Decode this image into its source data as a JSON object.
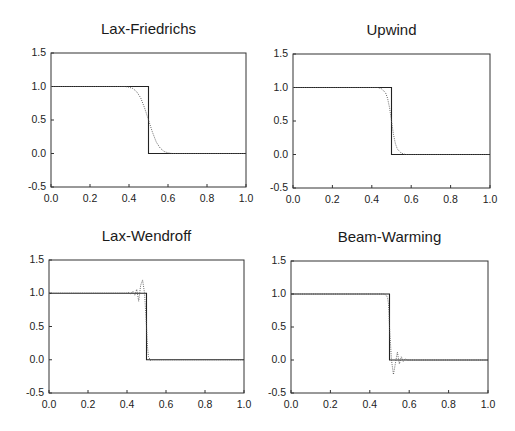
{
  "figure": {
    "panels": [
      {
        "id": "lax-friedrichs",
        "title": "Lax-Friedrichs",
        "box": {
          "left": 51,
          "top": 53,
          "right": 246,
          "bottom": 187
        }
      },
      {
        "id": "upwind",
        "title": "Upwind",
        "box": {
          "left": 293,
          "top": 54,
          "right": 490,
          "bottom": 188
        }
      },
      {
        "id": "lax-wendroff",
        "title": "Lax-Wendroff",
        "box": {
          "left": 49,
          "top": 260,
          "right": 244,
          "bottom": 393
        }
      },
      {
        "id": "beam-warming",
        "title": "Beam-Warming",
        "box": {
          "left": 291,
          "top": 261,
          "right": 488,
          "bottom": 393
        }
      }
    ],
    "xticks": [
      "0.0",
      "0.2",
      "0.4",
      "0.6",
      "0.8",
      "1.0"
    ],
    "yticks": [
      "1.5",
      "1.0",
      "0.5",
      "0.0",
      "-0.5"
    ]
  },
  "chart_data": [
    {
      "type": "line",
      "title": "Lax-Friedrichs",
      "xlabel": "",
      "ylabel": "",
      "xlim": [
        0,
        1
      ],
      "ylim": [
        -0.5,
        1.5
      ],
      "xticks": [
        0,
        0.2,
        0.4,
        0.6,
        0.8,
        1.0
      ],
      "yticks": [
        -0.5,
        0,
        0.5,
        1.0,
        1.5
      ],
      "grid": false,
      "series": [
        {
          "name": "exact",
          "style": "solid",
          "x": [
            0,
            0.5,
            0.5,
            1.0
          ],
          "y": [
            1,
            1,
            0,
            0
          ]
        },
        {
          "name": "numerical",
          "style": "dotted",
          "x": [
            0,
            0.38,
            0.4,
            0.42,
            0.44,
            0.46,
            0.48,
            0.5,
            0.52,
            0.54,
            0.56,
            0.58,
            0.6,
            0.62,
            1.0
          ],
          "y": [
            1,
            1,
            0.99,
            0.97,
            0.92,
            0.83,
            0.68,
            0.5,
            0.32,
            0.17,
            0.08,
            0.03,
            0.01,
            0,
            0
          ]
        }
      ]
    },
    {
      "type": "line",
      "title": "Upwind",
      "xlabel": "",
      "ylabel": "",
      "xlim": [
        0,
        1
      ],
      "ylim": [
        -0.5,
        1.5
      ],
      "xticks": [
        0,
        0.2,
        0.4,
        0.6,
        0.8,
        1.0
      ],
      "yticks": [
        -0.5,
        0,
        0.5,
        1.0,
        1.5
      ],
      "grid": false,
      "series": [
        {
          "name": "exact",
          "style": "solid",
          "x": [
            0,
            0.5,
            0.5,
            1.0
          ],
          "y": [
            1,
            1,
            0,
            0
          ]
        },
        {
          "name": "numerical",
          "style": "dotted",
          "x": [
            0,
            0.43,
            0.45,
            0.47,
            0.48,
            0.49,
            0.5,
            0.51,
            0.52,
            0.53,
            0.55,
            0.57,
            1.0
          ],
          "y": [
            1,
            1,
            0.98,
            0.92,
            0.84,
            0.7,
            0.5,
            0.3,
            0.16,
            0.08,
            0.02,
            0,
            0
          ]
        }
      ]
    },
    {
      "type": "line",
      "title": "Lax-Wendroff",
      "xlabel": "",
      "ylabel": "",
      "xlim": [
        0,
        1
      ],
      "ylim": [
        -0.5,
        1.5
      ],
      "xticks": [
        0,
        0.2,
        0.4,
        0.6,
        0.8,
        1.0
      ],
      "yticks": [
        -0.5,
        0,
        0.5,
        1.0,
        1.5
      ],
      "grid": false,
      "series": [
        {
          "name": "exact",
          "style": "solid",
          "x": [
            0,
            0.5,
            0.5,
            1.0
          ],
          "y": [
            1,
            1,
            0,
            0
          ]
        },
        {
          "name": "numerical",
          "style": "dotted",
          "x": [
            0,
            0.4,
            0.41,
            0.42,
            0.43,
            0.44,
            0.45,
            0.46,
            0.47,
            0.48,
            0.49,
            0.495,
            0.5,
            0.505,
            0.51,
            0.52,
            0.53,
            1.0
          ],
          "y": [
            1,
            1,
            1.01,
            0.99,
            1.03,
            0.97,
            1.06,
            0.88,
            1.12,
            1.2,
            1.0,
            0.75,
            0.5,
            0.2,
            0.05,
            -0.01,
            0,
            0
          ]
        }
      ]
    },
    {
      "type": "line",
      "title": "Beam-Warming",
      "xlabel": "",
      "ylabel": "",
      "xlim": [
        0,
        1
      ],
      "ylim": [
        -0.5,
        1.5
      ],
      "xticks": [
        0,
        0.2,
        0.4,
        0.6,
        0.8,
        1.0
      ],
      "yticks": [
        -0.5,
        0,
        0.5,
        1.0,
        1.5
      ],
      "grid": false,
      "series": [
        {
          "name": "exact",
          "style": "solid",
          "x": [
            0,
            0.5,
            0.5,
            1.0
          ],
          "y": [
            1,
            1,
            0,
            0
          ]
        },
        {
          "name": "numerical",
          "style": "dotted",
          "x": [
            0,
            0.47,
            0.48,
            0.49,
            0.495,
            0.5,
            0.505,
            0.51,
            0.52,
            0.53,
            0.54,
            0.55,
            0.56,
            0.57,
            0.58,
            0.59,
            0.6,
            1.0
          ],
          "y": [
            1,
            1,
            0.99,
            0.95,
            0.85,
            0.5,
            0.25,
            0.0,
            -0.22,
            -0.05,
            0.12,
            -0.06,
            0.05,
            -0.02,
            0.02,
            0,
            0,
            0
          ]
        }
      ]
    }
  ]
}
